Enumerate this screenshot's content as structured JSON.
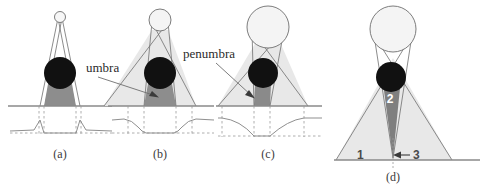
{
  "figure": {
    "type": "optics-diagram",
    "background_color": "#ffffff",
    "colors": {
      "outline": "#6e6e6e",
      "ground_line": "#8a8a8a",
      "penumbra_fill": "#e6e6e6",
      "umbra_fill": "#888888",
      "umbra_fill_dark": "#7a7a7a",
      "occluder_fill": "#111111",
      "source_fill": "#f2f2f2",
      "dashed": "#9a9a9a",
      "curve": "#8f8f8f",
      "text": "#3a3a3a",
      "text_white": "#ffffff"
    },
    "panels": [
      {
        "id": "a",
        "caption": "(a)",
        "source_size": "point",
        "has_intensity_curve": true,
        "curve_shape": "flat-bottom-dip",
        "labels": []
      },
      {
        "id": "b",
        "caption": "(b)",
        "source_size": "small-extended",
        "has_intensity_curve": true,
        "curve_shape": "trapezoid-dip",
        "labels": [
          "umbra"
        ]
      },
      {
        "id": "c",
        "caption": "(c)",
        "source_size": "large-extended",
        "has_intensity_curve": true,
        "curve_shape": "v-shaped-dip",
        "labels": [
          "penumbra"
        ]
      },
      {
        "id": "d",
        "caption": "(d)",
        "source_size": "large-extended",
        "has_intensity_curve": false,
        "labels": [
          "1",
          "2",
          "3"
        ]
      }
    ],
    "annotations": {
      "umbra_label": "umbra",
      "penumbra_label": "penumbra",
      "region_one": "1",
      "region_two": "2",
      "region_three": "3"
    },
    "captions": {
      "a": "(a)",
      "b": "(b)",
      "c": "(c)",
      "d": "(d)"
    }
  }
}
